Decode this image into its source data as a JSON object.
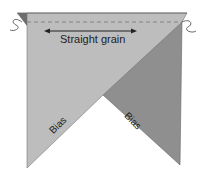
{
  "diagram": {
    "labels": {
      "straight_grain": "Straight grain",
      "bias_left": "Bias",
      "bias_right": "Bias"
    },
    "colors": {
      "light_fabric": "#bdbdbd",
      "dark_fabric": "#8f8f8f",
      "fold_triangle": "#6e6e6e",
      "outline": "#555555",
      "background": "#ffffff"
    }
  }
}
